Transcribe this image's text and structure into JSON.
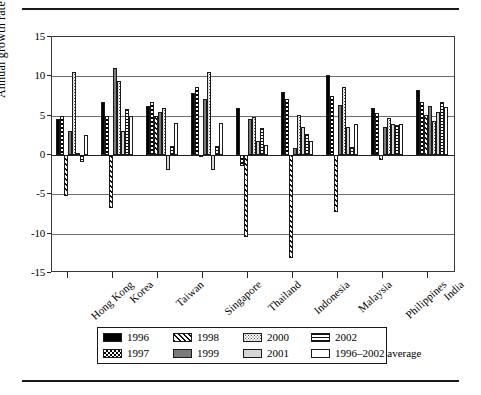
{
  "chart_data": {
    "type": "bar",
    "title": "",
    "subtitle": "",
    "xlabel": "",
    "ylabel": "Annual growth rate",
    "ylim": [
      -15,
      15
    ],
    "yticks": [
      "15",
      "10",
      "5",
      "0",
      "-5",
      "-10",
      "-15"
    ],
    "grid": true,
    "legend_position": "bottom",
    "categories": [
      "Hong Kong",
      "Korea",
      "Taiwan",
      "Singapore",
      "Thailand",
      "Indonesia",
      "Malaysia",
      "Philippines",
      "India"
    ],
    "series": [
      {
        "name": "1996",
        "pattern": "solid-black",
        "values": [
          4.6,
          6.8,
          6.2,
          7.9,
          6.0,
          8.0,
          10.2,
          6.0,
          8.3
        ]
      },
      {
        "name": "1997",
        "pattern": "checkerboard",
        "values": [
          4.9,
          5.0,
          6.8,
          8.7,
          -1.4,
          7.1,
          7.5,
          5.4,
          6.7
        ]
      },
      {
        "name": "1998",
        "pattern": "diagonal-hatch",
        "values": [
          -5.2,
          -6.7,
          4.9,
          -0.2,
          -10.4,
          -13.1,
          -7.3,
          -0.6,
          5.1
        ]
      },
      {
        "name": "1999",
        "pattern": "solid-gray",
        "values": [
          3.1,
          11.0,
          5.5,
          7.1,
          4.6,
          0.9,
          6.4,
          3.6,
          6.2
        ]
      },
      {
        "name": "2000",
        "pattern": "fine-dots",
        "values": [
          10.6,
          9.4,
          6.0,
          10.5,
          4.8,
          5.1,
          8.6,
          4.7,
          4.3
        ]
      },
      {
        "name": "2001",
        "pattern": "light-gray",
        "values": [
          0.2,
          3.1,
          -1.9,
          -1.9,
          1.8,
          3.5,
          3.5,
          4.0,
          5.5
        ]
      },
      {
        "name": "2002",
        "pattern": "horizontal-lines",
        "values": [
          -0.9,
          5.8,
          1.1,
          1.1,
          3.4,
          2.7,
          1.0,
          3.8,
          6.7
        ]
      },
      {
        "name": "1996–2002 average",
        "pattern": "white",
        "values": [
          2.6,
          5.0,
          4.1,
          4.1,
          1.3,
          1.8,
          4.0,
          3.9,
          6.1
        ]
      }
    ]
  },
  "legend": {
    "entries": [
      {
        "label": "1996"
      },
      {
        "label": "1998"
      },
      {
        "label": "2000"
      },
      {
        "label": "2002"
      },
      {
        "label": "1997"
      },
      {
        "label": "1999"
      },
      {
        "label": "2001"
      },
      {
        "label": "1996–2002 average"
      }
    ]
  }
}
